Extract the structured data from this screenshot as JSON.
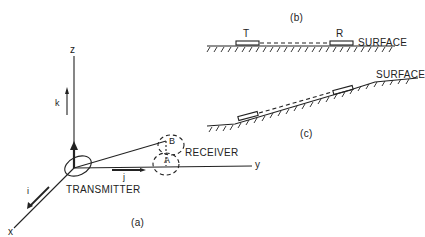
{
  "panel_a": {
    "caption": "(a)",
    "axis_z": "z",
    "axis_y": "y",
    "axis_x": "x",
    "vec_k": "k",
    "vec_i": "i",
    "vec_j": "j",
    "transmitter": "TRANSMITTER",
    "receiver": "RECEIVER",
    "point_a": "A",
    "point_b": "B"
  },
  "panel_b": {
    "caption": "(b)",
    "t_label": "T",
    "r_label": "R",
    "surface": "SURFACE"
  },
  "panel_c": {
    "caption": "(c)",
    "surface": "SURFACE"
  },
  "colors": {
    "ink": "#222222",
    "background": "#ffffff"
  }
}
